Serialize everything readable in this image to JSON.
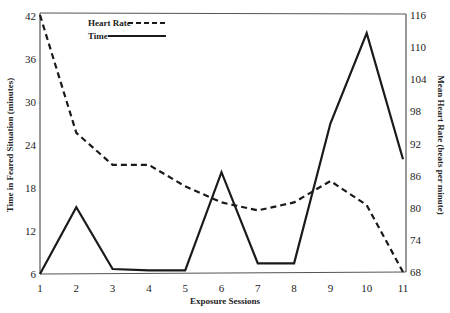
{
  "chart_data": {
    "type": "line",
    "title": "",
    "xlabel": "Exposure Sessions",
    "ylabel": "Time in Feared Situation (minutes)",
    "ylabel_right": "Mean Heart Rate (beats per minute)",
    "x": [
      1,
      2,
      3,
      4,
      5,
      6,
      7,
      8,
      9,
      10,
      11
    ],
    "ylim": [
      6,
      42
    ],
    "ylim_right": [
      68,
      116
    ],
    "yticks": [
      6,
      12,
      18,
      24,
      30,
      36,
      42
    ],
    "yticks_right": [
      68,
      74,
      80,
      86,
      92,
      98,
      104,
      110,
      116
    ],
    "grid": false,
    "legend_position": "upper-left-inside",
    "series": [
      {
        "name": "Heart Rate",
        "axis": "right",
        "style": "dashed",
        "values": [
          116,
          94,
          88,
          88,
          84,
          81,
          79.5,
          81,
          85,
          80.5,
          68
        ]
      },
      {
        "name": "Time",
        "axis": "left",
        "style": "solid",
        "values": [
          6,
          15.3,
          6.7,
          6.5,
          6.5,
          20.2,
          7.5,
          7.5,
          27,
          39.6,
          22
        ]
      }
    ]
  },
  "legend": {
    "heart_rate": "Heart Rate",
    "time": "Time"
  },
  "axes": {
    "x_title": "Exposure Sessions",
    "y_left_title": "Time in Feared Situation (minutes)",
    "y_right_title": "Mean Heart Rate (beats per minute)"
  }
}
